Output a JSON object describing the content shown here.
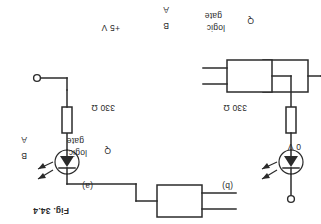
{
  "figure": {
    "caption": "Fig. 34.4",
    "background_color": "#ffffff",
    "ink_color": "#2b2b2b",
    "orientation": "rotated-180"
  },
  "circuits": [
    {
      "id": "a",
      "sublabel": "(a)",
      "gate": {
        "line1": "logic",
        "line2": "gate",
        "inputs": [
          "A",
          "B"
        ],
        "output": "Q"
      },
      "resistor": {
        "value": "330 Ω"
      },
      "led": {
        "name": "LED",
        "emission": "light arrows"
      },
      "supply": {
        "terminal": "+5 V"
      },
      "description": "LED anode to +5 V, cathode through 330 Ω to gate output Q (current sinking)"
    },
    {
      "id": "b",
      "sublabel": "(b)",
      "gate": {
        "line1": "logic",
        "line2": "gate",
        "inputs": [
          "A",
          "B"
        ],
        "output": "Q"
      },
      "resistor": {
        "value": "330 Ω"
      },
      "led": {
        "name": "LED",
        "emission": "light arrows"
      },
      "supply": {
        "terminal": "0 V"
      },
      "description": "Gate output Q drives LED anode, cathode through 330 Ω to 0 V (current sourcing)"
    }
  ]
}
